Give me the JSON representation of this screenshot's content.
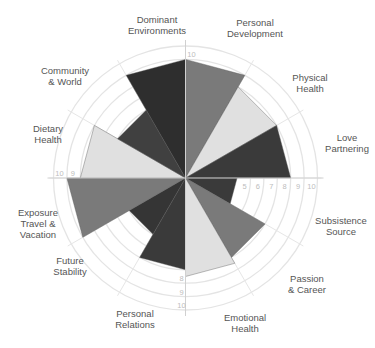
{
  "chart_data": {
    "type": "polar-area",
    "title": "",
    "categories": [
      "Personal\nDevelopment",
      "Physical\nHealth",
      "Love\nPartnering",
      "Subsistence\nSource",
      "Passion\n& Career",
      "Emotional\nHealth",
      "Personal\nRelations",
      "Future\nStability",
      "Exposure\nTravel &\nVacation",
      "Dietary\nHealth",
      "Community\n& World",
      "Dominant\nEnvironments"
    ],
    "values": [
      9,
      8,
      8,
      4,
      7,
      7.5,
      7,
      5,
      9,
      8,
      6,
      9
    ],
    "colors": [
      "#7a7a7a",
      "#e0e0e0",
      "#3a3a3a",
      "#3a3a3a",
      "#7a7a7a",
      "#e0e0e0",
      "#3a3a3a",
      "#353535",
      "#7a7a7a",
      "#e0e0e0",
      "#404040",
      "#2e2e2e"
    ],
    "rlim": [
      0,
      10
    ],
    "ring_values": [
      5,
      6,
      7,
      8,
      9,
      10
    ],
    "axis_tick_labels": {
      "top": [
        "10"
      ],
      "right": [
        "5",
        "6",
        "7",
        "8",
        "9",
        "10"
      ],
      "bottom": [
        "8",
        "9",
        "10"
      ],
      "left": [
        "10",
        "9"
      ]
    },
    "start_angle_deg": 0,
    "direction": "clockwise",
    "grid": true,
    "legend": "none"
  }
}
